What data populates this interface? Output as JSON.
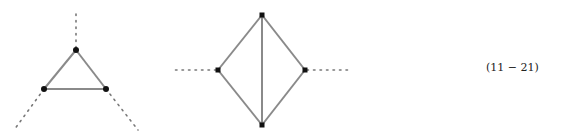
{
  "equation_number": "(11 − 21)",
  "diagrams": [
    {
      "name": "triangle-vertex-diagram",
      "vertices": [
        [
          76,
          50
        ],
        [
          44,
          89
        ],
        [
          106,
          89
        ]
      ],
      "edges": [
        [
          0,
          1
        ],
        [
          1,
          2
        ],
        [
          2,
          0
        ]
      ],
      "external_lines": [
        [
          [
            76,
            50
          ],
          [
            76,
            10
          ]
        ],
        [
          [
            44,
            89
          ],
          [
            14,
            130
          ]
        ],
        [
          [
            106,
            89
          ],
          [
            138,
            130
          ]
        ]
      ]
    },
    {
      "name": "diamond-vertex-diagram",
      "vertices": [
        [
          262,
          15
        ],
        [
          218,
          70
        ],
        [
          305,
          70
        ],
        [
          262,
          125
        ]
      ],
      "edges": [
        [
          0,
          1
        ],
        [
          0,
          2
        ],
        [
          1,
          3
        ],
        [
          2,
          3
        ],
        [
          0,
          3
        ]
      ],
      "external_lines": [
        [
          [
            218,
            70
          ],
          [
            174,
            70
          ]
        ],
        [
          [
            305,
            70
          ],
          [
            350,
            70
          ]
        ]
      ]
    }
  ]
}
